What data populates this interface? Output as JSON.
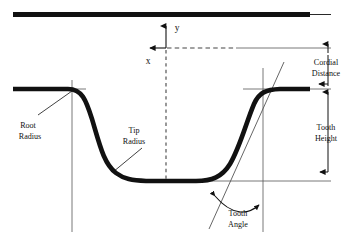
{
  "figure": {
    "kind": "engineering-profile-diagram",
    "background_color": "#ffffff",
    "ink_color": "#111111",
    "thin_line_color": "#555555"
  },
  "axes": {
    "y_label": "y",
    "x_label": "x",
    "y_axis_direction": "up",
    "x_axis_direction": "left"
  },
  "annotations": {
    "root_radius": {
      "line1": "Root",
      "line2": "Radius"
    },
    "tip_radius": {
      "line1": "Tip",
      "line2": "Radius"
    },
    "tooth_angle": {
      "line1": "Tooth",
      "line2": "Angle"
    },
    "cordial_distance": {
      "line1": "Cordial",
      "line2": "Distance"
    },
    "tooth_height": {
      "line1": "Tooth",
      "line2": "Height"
    }
  }
}
